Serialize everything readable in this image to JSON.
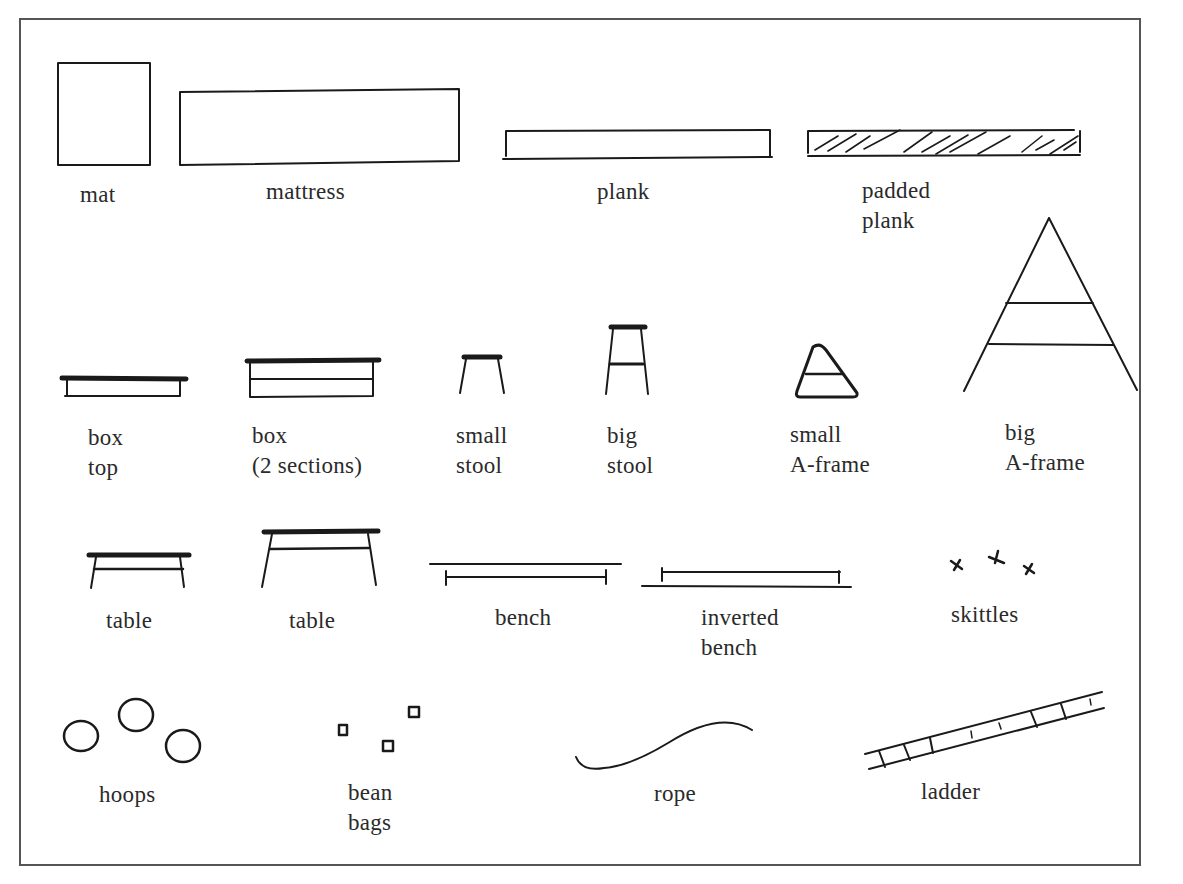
{
  "diagram": {
    "type": "equipment-symbol-key",
    "colors": {
      "ink": "#1a1a1a",
      "text": "#2a2a2a",
      "border": "#555555",
      "background": "#ffffff"
    },
    "items": [
      {
        "id": "mat",
        "line1": "mat",
        "line2": ""
      },
      {
        "id": "mattress",
        "line1": "mattress",
        "line2": ""
      },
      {
        "id": "plank",
        "line1": "plank",
        "line2": ""
      },
      {
        "id": "padded-plank",
        "line1": "padded",
        "line2": "plank"
      },
      {
        "id": "box-top",
        "line1": "box",
        "line2": "top"
      },
      {
        "id": "box-2-sections",
        "line1": "box",
        "line2": "(2 sections)"
      },
      {
        "id": "small-stool",
        "line1": "small",
        "line2": "stool"
      },
      {
        "id": "big-stool",
        "line1": "big",
        "line2": "stool"
      },
      {
        "id": "small-a-frame",
        "line1": "small",
        "line2": "A-frame"
      },
      {
        "id": "big-a-frame",
        "line1": "big",
        "line2": "A-frame"
      },
      {
        "id": "table-low",
        "line1": "table",
        "line2": ""
      },
      {
        "id": "table-high",
        "line1": "table",
        "line2": ""
      },
      {
        "id": "bench",
        "line1": "bench",
        "line2": ""
      },
      {
        "id": "inverted-bench",
        "line1": "inverted",
        "line2": "bench"
      },
      {
        "id": "skittles",
        "line1": "skittles",
        "line2": ""
      },
      {
        "id": "hoops",
        "line1": "hoops",
        "line2": ""
      },
      {
        "id": "bean-bags",
        "line1": "bean",
        "line2": "bags"
      },
      {
        "id": "rope",
        "line1": "rope",
        "line2": ""
      },
      {
        "id": "ladder",
        "line1": "ladder",
        "line2": ""
      }
    ]
  }
}
